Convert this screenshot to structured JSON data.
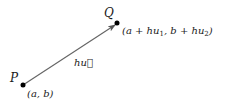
{
  "diagram": {
    "points": [
      {
        "id": "P",
        "label": "P",
        "coord_label": "(a, b)",
        "x": 23,
        "y": 85
      },
      {
        "id": "Q",
        "label": "Q",
        "coord_label_parts": [
          "(a + hu",
          "1",
          ", b + hu",
          "2",
          ")"
        ],
        "x": 117,
        "y": 23
      }
    ],
    "vector": {
      "from": "P",
      "to": "Q",
      "label": "hu⃗"
    },
    "colors": {
      "arrow": "#666666",
      "point": "#000000",
      "text": "#1a1a1a"
    }
  }
}
